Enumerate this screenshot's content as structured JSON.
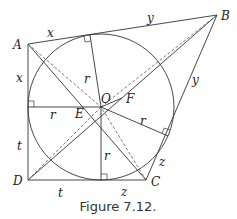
{
  "figure": {
    "caption": "Figure 7.12.",
    "points": {
      "A": "A",
      "B": "B",
      "C": "C",
      "D": "D",
      "O": "O",
      "E": "E",
      "F": "F"
    },
    "segment_labels": {
      "AB_left": "x",
      "AB_right": "y",
      "AD_top": "x",
      "AD_bottom": "t",
      "DC_left": "t",
      "DC_right": "z",
      "BC_top": "y",
      "BC_bottom": "z",
      "r_top": "r",
      "r_left": "r",
      "r_bottom": "r",
      "r_right": "r"
    }
  }
}
